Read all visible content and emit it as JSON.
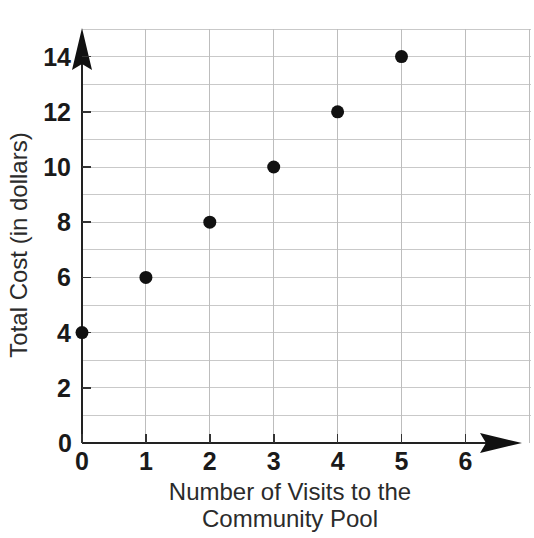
{
  "chart_data": {
    "type": "scatter",
    "title": "",
    "xlabel": "Number of Visits to the Community Pool",
    "xlabel_line1": "Number of Visits to the",
    "xlabel_line2": "Community Pool",
    "ylabel": "Total Cost (in dollars)",
    "x": [
      0,
      1,
      2,
      3,
      4,
      5
    ],
    "values": [
      4,
      6,
      8,
      10,
      12,
      14
    ],
    "points": [
      {
        "x": 0,
        "y": 4
      },
      {
        "x": 1,
        "y": 6
      },
      {
        "x": 2,
        "y": 8
      },
      {
        "x": 3,
        "y": 10
      },
      {
        "x": 4,
        "y": 12
      },
      {
        "x": 5,
        "y": 14
      }
    ],
    "xlim": [
      0,
      6.6
    ],
    "ylim": [
      0,
      15
    ],
    "xticks": [
      0,
      1,
      2,
      3,
      4,
      5,
      6
    ],
    "xtick_labels": [
      "0",
      "1",
      "2",
      "3",
      "4",
      "5",
      "6"
    ],
    "yticks": [
      0,
      2,
      4,
      6,
      8,
      10,
      12,
      14
    ],
    "ytick_labels": [
      "0",
      "2",
      "4",
      "6",
      "8",
      "10",
      "12",
      "14"
    ],
    "y_minor_step": 1,
    "grid": true,
    "grid_color": "#c9c9c9",
    "legend": null,
    "marker_color": "#111111",
    "axis_color": "#222222",
    "origin_label": "0"
  }
}
